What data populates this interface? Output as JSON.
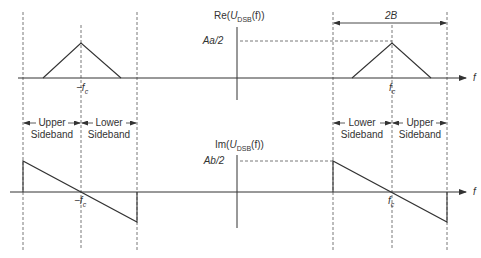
{
  "diagram": {
    "colors": {
      "line": "#333333",
      "dashed": "#555555",
      "background": "#ffffff"
    },
    "top_plot": {
      "ylabel_prefix": "Re(",
      "ylabel_var": "U",
      "ylabel_sub": "DSB",
      "ylabel_suffix": "(f))",
      "level_label": "Aa/2",
      "x_axis_label": "f",
      "neg_carrier_label": "−f",
      "neg_carrier_sub": "c",
      "pos_carrier_label": "f",
      "pos_carrier_sub": "c",
      "bandwidth_label": "2B"
    },
    "bottom_plot": {
      "ylabel_prefix": "Im(",
      "ylabel_var": "U",
      "ylabel_sub": "DSB",
      "ylabel_suffix": "(f))",
      "level_label": "Ab/2",
      "x_axis_label": "f",
      "neg_carrier_label": "−f",
      "neg_carrier_sub": "c",
      "pos_carrier_label": "f",
      "pos_carrier_sub": "c"
    },
    "sidebands": {
      "left": [
        {
          "line1": "Upper",
          "line2": "Sideband"
        },
        {
          "line1": "Lower",
          "line2": "Sideband"
        }
      ],
      "right": [
        {
          "line1": "Lower",
          "line2": "Sideband"
        },
        {
          "line1": "Upper",
          "line2": "Sideband"
        }
      ]
    }
  }
}
